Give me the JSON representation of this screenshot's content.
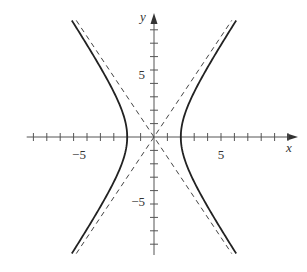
{
  "chart_data": {
    "type": "line",
    "title": "",
    "xlabel": "x",
    "ylabel": "y",
    "xlim": [
      -9.5,
      10.5
    ],
    "ylim": [
      -8.8,
      9.2
    ],
    "grid": false,
    "legend": null,
    "x_ticks": [
      -9,
      -8,
      -7,
      -6,
      -5,
      -4,
      -3,
      -2,
      -1,
      1,
      2,
      3,
      4,
      5,
      6,
      7,
      8,
      9,
      10
    ],
    "y_ticks": [
      -8,
      -7,
      -6,
      -5,
      -4,
      -3,
      -2,
      -1,
      1,
      2,
      3,
      4,
      5,
      6,
      7,
      8
    ],
    "x_tick_labels": [
      {
        "value": -5,
        "text": "−5"
      },
      {
        "value": 5,
        "text": "5"
      }
    ],
    "y_tick_labels": [
      {
        "value": 5,
        "text": "5"
      },
      {
        "value": -5,
        "text": "−5"
      }
    ],
    "series": [
      {
        "name": "hyperbola",
        "equation": "x^2/4 - y^2/9 = 1",
        "style": "solid",
        "a": 2,
        "b": 3,
        "y_range": [
          -8.7,
          8.7
        ]
      },
      {
        "name": "asymptote 1",
        "equation": "y = 1.5x",
        "style": "dashed"
      },
      {
        "name": "asymptote 2",
        "equation": "y = -1.5x",
        "style": "dashed"
      }
    ]
  },
  "labels": {
    "x": "x",
    "y": "y",
    "neg5": "−5",
    "pos5": "5"
  },
  "colors": {
    "axis": "#555555",
    "curve": "#222222",
    "dash": "#444444"
  }
}
